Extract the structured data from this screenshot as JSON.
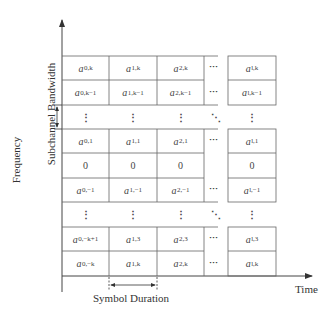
{
  "axes": {
    "y_label": "Frequency",
    "x_label": "Time",
    "bandwidth_label": "Subchannel Bandwidth",
    "duration_label": "Symbol Duration"
  },
  "grid": {
    "columns": [
      "0",
      "1",
      "2",
      "...",
      "l"
    ],
    "rows": [
      {
        "cells": [
          {
            "base": "a",
            "sub": "0,k"
          },
          {
            "base": "a",
            "sub": "1,k"
          },
          {
            "base": "a",
            "sub": "2,k"
          },
          {
            "text": "..."
          },
          {
            "base": "a",
            "sub": "l,k"
          }
        ]
      },
      {
        "cells": [
          {
            "base": "a",
            "sub": "0,k−1"
          },
          {
            "base": "a",
            "sub": "1,k−1"
          },
          {
            "base": "a",
            "sub": "2,k−1"
          },
          {
            "text": "..."
          },
          {
            "base": "a",
            "sub": "l,k−1"
          }
        ]
      },
      {
        "cells": [
          {
            "text": "⋮"
          },
          {
            "text": "⋮"
          },
          {
            "text": "⋮"
          },
          {
            "text": "⋱"
          },
          {
            "text": "⋮"
          }
        ]
      },
      {
        "cells": [
          {
            "base": "a",
            "sub": "0,1"
          },
          {
            "base": "a",
            "sub": "1,1"
          },
          {
            "base": "a",
            "sub": "2,1"
          },
          {
            "text": "..."
          },
          {
            "base": "a",
            "sub": "l,1"
          }
        ]
      },
      {
        "cells": [
          {
            "text": "0"
          },
          {
            "text": "0"
          },
          {
            "text": "0"
          },
          {
            "text": ""
          },
          {
            "text": "0"
          }
        ]
      },
      {
        "cells": [
          {
            "base": "a",
            "sub": "0,−1"
          },
          {
            "base": "a",
            "sub": "1,−1"
          },
          {
            "base": "a",
            "sub": "2,−1"
          },
          {
            "text": "..."
          },
          {
            "base": "a",
            "sub": "l,−1"
          }
        ]
      },
      {
        "cells": [
          {
            "text": "⋮"
          },
          {
            "text": "⋮"
          },
          {
            "text": "⋮"
          },
          {
            "text": "⋱"
          },
          {
            "text": "⋮"
          }
        ]
      },
      {
        "cells": [
          {
            "base": "a",
            "sub": "0,−k+1"
          },
          {
            "base": "a",
            "sub": "1,3"
          },
          {
            "base": "a",
            "sub": "2,3"
          },
          {
            "text": "..."
          },
          {
            "base": "a",
            "sub": "l,3"
          }
        ]
      },
      {
        "cells": [
          {
            "base": "a",
            "sub": "0,−k"
          },
          {
            "base": "a",
            "sub": "1,k"
          },
          {
            "base": "a",
            "sub": "2,k"
          },
          {
            "text": "..."
          },
          {
            "base": "a",
            "sub": "l,k"
          }
        ]
      }
    ]
  },
  "cells_flat": {
    "r0": {
      "c0": "0,k",
      "c1": "1,k",
      "c2": "2,k",
      "c4": "l,k"
    },
    "r1": {
      "c0": "0,k−1",
      "c1": "1,k−1",
      "c2": "2,k−1",
      "c4": "l,k−1"
    },
    "r3": {
      "c0": "0,1",
      "c1": "1,1",
      "c2": "2,1",
      "c4": "l,1"
    },
    "r4": {
      "c0": "0",
      "c1": "0",
      "c2": "0",
      "c4": "0"
    },
    "r5": {
      "c0": "0,−1",
      "c1": "1,−1",
      "c2": "2,−1",
      "c4": "l,−1"
    },
    "r7": {
      "c0": "0,−k+1",
      "c1": "1,3",
      "c2": "2,3",
      "c4": "l,3"
    },
    "r8": {
      "c0": "0,−k",
      "c1": "1,k",
      "c2": "2,k",
      "c4": "l,k"
    }
  },
  "symbols": {
    "base": "a",
    "hdots": "···",
    "vdots": "⋮",
    "ddots": "⋱"
  },
  "colors": {
    "line": "#555555",
    "text": "#333333"
  }
}
